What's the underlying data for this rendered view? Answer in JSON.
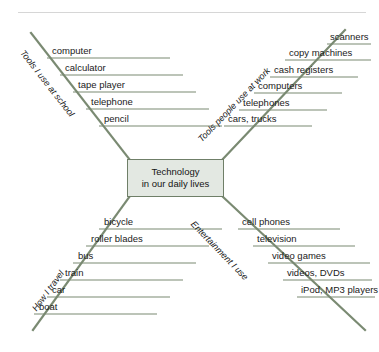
{
  "diagram": {
    "type": "fishbone-diagram",
    "center": {
      "line1": "Technology",
      "line2": "in our daily lives"
    },
    "branches": [
      {
        "id": "tools-school",
        "label": "Tools I use at school",
        "position": "top-left",
        "items": [
          "computer",
          "calculator",
          "tape player",
          "telephone",
          "pencil"
        ]
      },
      {
        "id": "tools-work",
        "label": "Tools people use at work",
        "position": "top-right",
        "items": [
          "scanners",
          "copy machines",
          "cash registers",
          "computers",
          "telephones",
          "cars, trucks"
        ]
      },
      {
        "id": "how-i-travel",
        "label": "How I travel",
        "position": "bottom-left",
        "items": [
          "bicycle",
          "roller blades",
          "bus",
          "train",
          "car",
          "boat"
        ]
      },
      {
        "id": "entertainment",
        "label": "Entertainment I use",
        "position": "bottom-right",
        "items": [
          "cell phones",
          "television",
          "video games",
          "videos, DVDs",
          "iPod, MP3 players"
        ]
      }
    ],
    "colors": {
      "spine": "#7a8a72",
      "rib": "#7a8a72",
      "box_fill": "#e3e8e2",
      "box_border": "#6f7f68",
      "text": "#1a1a1a",
      "rule": "#d6d6d6"
    }
  }
}
